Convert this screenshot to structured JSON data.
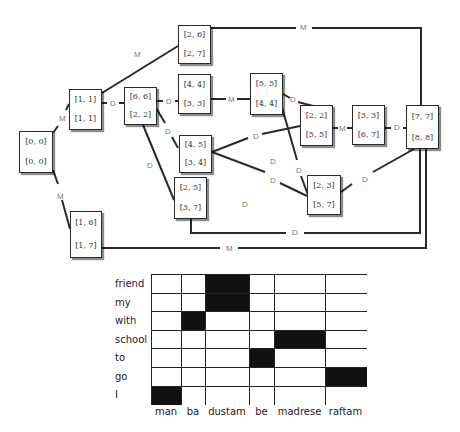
{
  "graph": {
    "nodes": [
      {
        "id": "n00",
        "top": "[0, 0]",
        "bottom": "[0, 0]"
      },
      {
        "id": "n11",
        "top": "[1, 1]",
        "bottom": "[1, 1]"
      },
      {
        "id": "n26",
        "top": "[2, 6]",
        "bottom": "[2, 7]"
      },
      {
        "id": "n66",
        "top": "[6, 6]",
        "bottom": "[2, 2]"
      },
      {
        "id": "n44",
        "top": "[4, 4]",
        "bottom": "[3, 3]"
      },
      {
        "id": "n55",
        "top": "[5, 5]",
        "bottom": "[4, 4]"
      },
      {
        "id": "n22",
        "top": "[2, 2]",
        "bottom": "[5, 5]"
      },
      {
        "id": "n33",
        "top": "[3, 3]",
        "bottom": "[6, 7]"
      },
      {
        "id": "n77",
        "top": "[7, 7]",
        "bottom": "[8, 8]"
      },
      {
        "id": "n45",
        "top": "[4, 5]",
        "bottom": "[3, 4]"
      },
      {
        "id": "n25",
        "top": "[2, 5]",
        "bottom": "[3, 7]"
      },
      {
        "id": "n23",
        "top": "[2, 3]",
        "bottom": "[5, 7]"
      },
      {
        "id": "n16",
        "top": "[1, 6]",
        "bottom": "[1, 7]"
      }
    ],
    "edge_labels": {
      "m_00_11": "M",
      "m_00_16": "M",
      "m_11_26": "M",
      "d_11_66": "D",
      "m_26_77": "M",
      "d_66_44": "D",
      "d_66_45": "D",
      "d_66_25": "D",
      "m_44_55": "M",
      "d_55_22": "D",
      "d_55_23": "D",
      "d_45_22": "D",
      "d_45_23": "D",
      "d_mid": "D",
      "d_lower": "D",
      "m_22_33": "M",
      "d_33_77": "D",
      "d_23_77": "D",
      "d_25_77": "D",
      "m_16_77": "M"
    }
  },
  "alignment_matrix": {
    "rows": [
      "friend",
      "my",
      "with",
      "school",
      "to",
      "go",
      "I"
    ],
    "columns": [
      "man",
      "ba",
      "dustam",
      "be",
      "madrese",
      "raftam"
    ],
    "filled": [
      [
        0,
        0,
        1,
        0,
        0,
        0
      ],
      [
        0,
        0,
        1,
        0,
        0,
        0
      ],
      [
        0,
        1,
        0,
        0,
        0,
        0
      ],
      [
        0,
        0,
        0,
        0,
        1,
        0
      ],
      [
        0,
        0,
        0,
        1,
        0,
        0
      ],
      [
        0,
        0,
        0,
        0,
        0,
        1
      ],
      [
        1,
        0,
        0,
        0,
        0,
        0
      ]
    ]
  },
  "colors": {
    "line": "#2a2a2a",
    "label": "#7a7a7a",
    "filled_cell": "#111111"
  }
}
